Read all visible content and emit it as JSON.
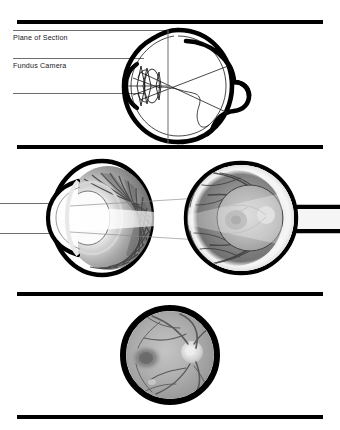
{
  "figure": {
    "background_color": "#ffffff",
    "width": 340,
    "height": 430,
    "rule_color": "#000000"
  },
  "rules": [
    {
      "name": "top-rule",
      "y": 20
    },
    {
      "name": "upper-middle-rule",
      "y": 145
    },
    {
      "name": "lower-middle-rule",
      "y": 292
    },
    {
      "name": "bottom-rule",
      "y": 415
    }
  ],
  "panels": [
    {
      "id": "panel-schematic",
      "name": "schematic-eye-with-camera-optics",
      "labels": [
        {
          "name": "plane-of-section-label",
          "text": "Plane of Section",
          "x": 13,
          "y": 33
        },
        {
          "name": "fundus-camera-label",
          "text": "Fundus Camera",
          "x": 13,
          "y": 61
        }
      ],
      "leader_lines": [
        {
          "name": "leader-line-top",
          "x": 13,
          "y": 30,
          "width": 155,
          "color": "#6e6e6e"
        },
        {
          "name": "leader-line-middle",
          "x": 13,
          "y": 58,
          "width": 131,
          "color": "#6e6e6e"
        },
        {
          "name": "leader-line-bottom",
          "x": 13,
          "y": 93,
          "width": 131,
          "color": "#6e6e6e"
        }
      ],
      "plane_of_section": {
        "name": "plane-of-section-marker",
        "x": 168,
        "y_top": 30,
        "y_bottom": 143,
        "color": "#6e6e6e"
      }
    },
    {
      "id": "panel-cutaway",
      "name": "cutaway-eye-ciliary-and-fundus",
      "ray_lines": [
        {
          "name": "incoming-ray-upper",
          "x": 0,
          "y": 203,
          "width": 56,
          "color": "#6e6e6e"
        },
        {
          "name": "incoming-ray-lower",
          "x": 0,
          "y": 233,
          "width": 56,
          "color": "#6e6e6e"
        }
      ],
      "structures": [
        {
          "name": "anterior-segment-cup",
          "description": "ciliary processes radiating from lens"
        },
        {
          "name": "posterior-segment-globe",
          "description": "retina with vessels, macula and optic disc"
        },
        {
          "name": "optic-nerve-stub",
          "description": "nerve exiting to the right"
        },
        {
          "name": "illumination-cone",
          "description": "light cone from camera into fundus"
        }
      ]
    },
    {
      "id": "panel-fundus-photo",
      "name": "fundus-photograph",
      "photo": {
        "name": "fundus-image-disc",
        "cx": 170,
        "cy": 355,
        "r": 49,
        "ring_color": "#000000",
        "features": [
          {
            "name": "optic-disc",
            "cx": 192,
            "cy": 352,
            "r": 11
          },
          {
            "name": "macula",
            "cx": 145,
            "cy": 358,
            "r": 13
          },
          {
            "name": "retinal-vessels",
            "count": 9
          }
        ]
      }
    }
  ],
  "colors": {
    "ink": "#000000",
    "line_gray": "#6e6e6e",
    "retina_dark": "#5a5a5a",
    "retina_light": "#b9b9b9",
    "disc_bright": "#e8e8e8",
    "macula_dark": "#4a4a4a",
    "sclera_white": "#f2f2f2"
  }
}
